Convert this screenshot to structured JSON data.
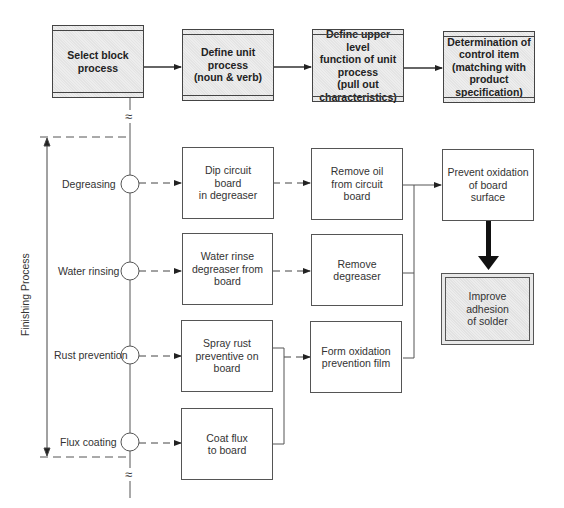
{
  "header": {
    "steps": [
      {
        "label": "Select block\nprocess"
      },
      {
        "label": "Define unit\nprocess\n(noun & verb)"
      },
      {
        "label": "Define upper level\nfunction of unit\nprocess\n(pull out\ncharacteristics)"
      },
      {
        "label": "Determination of\ncontrol item\n(matching with\nproduct\nspecification)"
      }
    ]
  },
  "block_process": {
    "axis_label": "Finishing Process",
    "break_symbol": "≈",
    "steps": [
      {
        "name": "Degreasing"
      },
      {
        "name": "Water rinsing"
      },
      {
        "name": "Rust prevention"
      },
      {
        "name": "Flux coating"
      }
    ]
  },
  "unit_processes": [
    {
      "label": "Dip circuit\nboard\nin degreaser"
    },
    {
      "label": "Water rinse\ndegreaser from\nboard"
    },
    {
      "label": "Spray rust\npreventive on\nboard"
    },
    {
      "label": "Coat flux\nto board"
    }
  ],
  "upper_functions": [
    {
      "label": "Remove oil\nfrom circuit\nboard"
    },
    {
      "label": "Remove\ndegreaser"
    },
    {
      "label": "Form oxidation\nprevention film"
    }
  ],
  "control_items": {
    "function": {
      "label": "Prevent oxidation\nof board\nsurface"
    },
    "result": {
      "label": "Improve adhesion\nof solder"
    }
  }
}
